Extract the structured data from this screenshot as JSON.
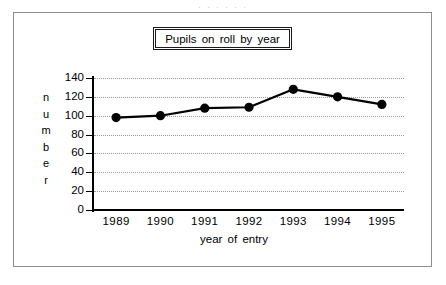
{
  "figure": {
    "title": "Pupils on roll by year",
    "scan_artifact": ". .  . .  .      .",
    "frame_color": "#8c8c8c",
    "series_color": "#000000"
  },
  "chart_data": {
    "type": "line",
    "title": "Pupils on roll by year",
    "xlabel": "year of entry",
    "ylabel": "number",
    "categories": [
      "1989",
      "1990",
      "1991",
      "1992",
      "1993",
      "1994",
      "1995"
    ],
    "values": [
      98,
      100,
      108,
      109,
      128,
      120,
      112
    ],
    "ylim": [
      0,
      140
    ],
    "ytick_labels": [
      "0",
      "20",
      "40",
      "60",
      "80",
      "100",
      "120",
      "140"
    ],
    "ytick_values": [
      0,
      20,
      40,
      60,
      80,
      100,
      120,
      140
    ],
    "grid": true,
    "grid_style": "dotted",
    "legend": null,
    "marker": "filled-circle",
    "line_color": "#000000",
    "marker_color": "#000000"
  }
}
